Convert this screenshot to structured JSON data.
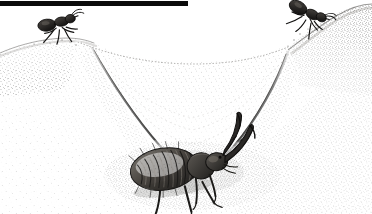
{
  "figure": {
    "title": "Antlion larva in sand pit trap with ants",
    "medium": "stipple pen-and-ink scientific illustration",
    "background_color": "#ffffff",
    "ink_color": "#1a1a1a",
    "sand_tone": "#8f8a82",
    "width": 372,
    "height": 214
  },
  "top_rule": {
    "label": "black horizontal rule",
    "x": 0,
    "y": 1,
    "width": 188,
    "height": 5,
    "color": "#0b0b0b"
  },
  "pit": {
    "label": "conical sand pit trap",
    "rim_left_label": "left pit rim",
    "rim_right_label": "right pit rim",
    "funnel_label": "funnel slope",
    "ridge_left_label": "left converging ridge line",
    "ridge_right_label": "right converging ridge line",
    "bottom_label": "pit floor"
  },
  "antlion": {
    "label": "antlion larva",
    "common_name": "doodlebug",
    "position": "bottom center of pit",
    "parts": [
      "abdomen",
      "thorax",
      "head",
      "left mandible",
      "right mandible",
      "legs"
    ],
    "segment_count": 7
  },
  "ants": [
    {
      "label": "ant on left rim",
      "facing": "left",
      "x": 58,
      "y": 24
    },
    {
      "label": "ant on right rim",
      "facing": "down-left",
      "x": 307,
      "y": 16
    }
  ],
  "stipple": {
    "density_label": "stipple density",
    "dot_color": "#2b2b2b"
  }
}
